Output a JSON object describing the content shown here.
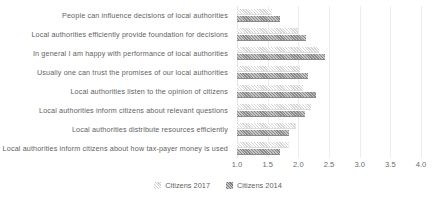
{
  "chart_data": {
    "type": "bar",
    "orientation": "horizontal",
    "title": "",
    "subtitle": "",
    "xlabel": "",
    "ylabel": "",
    "xlim": [
      1.0,
      4.0
    ],
    "xticks": [
      "1.0",
      "1.5",
      "2.0",
      "2.5",
      "3.0",
      "3.5",
      "4.0"
    ],
    "xtick_values": [
      1.0,
      1.5,
      2.0,
      2.5,
      3.0,
      3.5,
      4.0
    ],
    "grid": true,
    "grid_axis": "x",
    "legend_position": "bottom",
    "categories": [
      "People can influence decisions of local authorities",
      "Local authorities efficiently provide foundation for decisions",
      "In general I am happy with performance of local authorities",
      "Usually one can trust the promises of our local authorities",
      "Local authorities listen to the opinion of citizens",
      "Local authorities inform citizens about relevant questions",
      "Local authorities distribute resources efficiently",
      "Local authorities inform citizens about how tax-payer money is used"
    ],
    "series": [
      {
        "name": "Citizens 2017",
        "color": "#e9e9e9",
        "values": [
          1.57,
          2.0,
          2.34,
          2.03,
          2.08,
          2.2,
          1.97,
          1.84
        ]
      },
      {
        "name": "Citizens 2014",
        "color": "#9c9c9c",
        "values": [
          1.7,
          2.13,
          2.44,
          2.15,
          2.28,
          2.11,
          1.85,
          1.7
        ]
      }
    ]
  },
  "legend": {
    "items": [
      {
        "label": "Citizens 2017",
        "swatch": "s2017"
      },
      {
        "label": "Citizens 2014",
        "swatch": "s2014"
      }
    ]
  }
}
